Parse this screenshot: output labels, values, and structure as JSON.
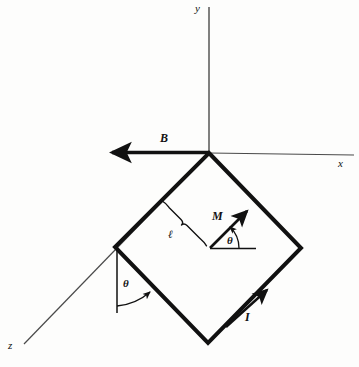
{
  "figure": {
    "type": "physics-diagram",
    "background_color": "#fdfdfc",
    "ink_color": "#111111"
  },
  "axes": {
    "origin": {
      "x": 209,
      "y": 153
    },
    "x_axis": {
      "label": "x",
      "label_x": 338,
      "label_y": 158,
      "from_x": 209,
      "from_y": 153,
      "to_x": 355,
      "to_y": 155
    },
    "y_axis": {
      "label": "y",
      "label_x": 195,
      "label_y": 3,
      "from_x": 209,
      "from_y": 153,
      "to_x": 209,
      "to_y": 6
    },
    "z_axis": {
      "label": "z",
      "label_x": 8,
      "label_y": 340,
      "from_x": 209,
      "from_y": 153,
      "to_x": 23,
      "to_y": 345
    }
  },
  "vectors": [
    {
      "name": "magnetic-field",
      "label": "B",
      "label_x": 160,
      "label_y": 132,
      "tail_x": 209,
      "tail_y": 152,
      "head_x": 106,
      "head_y": 152,
      "direction": "negative-x"
    },
    {
      "name": "magnetic-moment",
      "label": "M",
      "label_x": 212,
      "label_y": 210,
      "tail_x": 210,
      "tail_y": 248,
      "head_x": 250,
      "head_y": 207,
      "direction": "up-right"
    },
    {
      "name": "current",
      "label": "I",
      "label_x": 245,
      "label_y": 311,
      "tail_x": 208,
      "tail_y": 343,
      "head_x": 269,
      "head_y": 288,
      "direction": "up-right-along-lower-edge"
    }
  ],
  "loop": {
    "name": "square-current-loop",
    "shape": "square-rotated-45",
    "vertices": [
      {
        "name": "top",
        "x": 209,
        "y": 153
      },
      {
        "name": "right",
        "x": 301,
        "y": 248
      },
      {
        "name": "bottom",
        "x": 208,
        "y": 343
      },
      {
        "name": "left",
        "x": 115,
        "y": 247
      }
    ],
    "stroke_width": 4
  },
  "angles": [
    {
      "name": "moment-angle",
      "label": "θ",
      "label_x": 227,
      "label_y": 235,
      "vertex_x": 210,
      "vertex_y": 248,
      "reference": "horizontal-line-right",
      "ref_line_from_x": 210,
      "ref_line_from_y": 248,
      "ref_line_to_x": 256,
      "ref_line_to_y": 248
    },
    {
      "name": "loop-tilt-angle",
      "label": "θ",
      "label_x": 123,
      "label_y": 278,
      "vertex_x": 117,
      "vertex_y": 248,
      "reference": "vertical-line-down",
      "ref_line_from_x": 117,
      "ref_line_from_y": 248,
      "ref_line_to_x": 117,
      "ref_line_to_y": 313
    }
  ],
  "dimensions": [
    {
      "name": "side-length-brace",
      "label": "ℓ",
      "label_x": 168,
      "label_y": 229,
      "from_x": 163,
      "from_y": 203,
      "to_x": 209,
      "to_y": 249,
      "describes": "side length of the square loop"
    }
  ]
}
